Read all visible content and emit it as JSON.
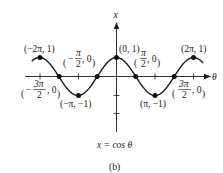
{
  "chart_data": {
    "type": "line",
    "title": "",
    "caption": "x = cos θ",
    "subfigure_label": "(b)",
    "xlabel": "θ",
    "ylabel": "x",
    "function": "x = cos θ",
    "xlim": [
      -2.2,
      2.3
    ],
    "xlim_units": "π",
    "ylim": [
      -2.0,
      2.0
    ],
    "x_ticks": [
      "-2π",
      "-3π/2",
      "-π",
      "-π/2",
      "0",
      "π/2",
      "π",
      "3π/2",
      "2π"
    ],
    "y_ticks": [
      1,
      -1,
      -2
    ],
    "grid": false,
    "legend": "none",
    "series": [
      {
        "name": "cos θ",
        "x": [
          -6.2832,
          -4.7124,
          -3.1416,
          -1.5708,
          0,
          1.5708,
          3.1416,
          4.7124,
          6.2832
        ],
        "y": [
          1,
          0,
          -1,
          0,
          1,
          0,
          -1,
          0,
          1
        ]
      }
    ],
    "points": [
      {
        "label": "(−2π, 1)",
        "x": -6.2832,
        "y": 1
      },
      {
        "label": "(−3π/2, 0)",
        "x": -4.7124,
        "y": 0
      },
      {
        "label": "(−π, −1)",
        "x": -3.1416,
        "y": -1
      },
      {
        "label": "(−π/2, 0)",
        "x": -1.5708,
        "y": 0
      },
      {
        "label": "(0, 1)",
        "x": 0,
        "y": 1
      },
      {
        "label": "(π/2, 0)",
        "x": 1.5708,
        "y": 0
      },
      {
        "label": "(π, −1)",
        "x": 3.1416,
        "y": -1
      },
      {
        "label": "(3π/2, 0)",
        "x": 4.7124,
        "y": 0
      },
      {
        "label": "(2π, 1)",
        "x": 6.2832,
        "y": 1
      }
    ]
  },
  "labels": {
    "axis_x": "x",
    "axis_theta": "θ",
    "caption": "x = cos θ",
    "sub": "(b)",
    "p_neg2pi": "(−2π, 1)",
    "p_negpi": "(−π, −1)",
    "p_zero": "(0, 1)",
    "p_pi": "(π, −1)",
    "p_2pi": "(2π, 1)",
    "pi": "π",
    "two": "2",
    "three_pi": "3π",
    "zero_tail": ", 0",
    "minus": "−"
  }
}
